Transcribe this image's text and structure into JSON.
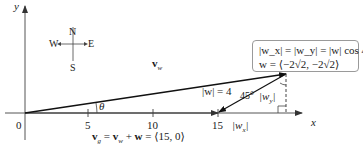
{
  "axes": {
    "x_label": "x",
    "y_label": "y",
    "origin_label": "0",
    "ticks": [
      "5",
      "10",
      "15"
    ]
  },
  "compass": {
    "north": "N",
    "south": "S",
    "east": "E",
    "west": "W"
  },
  "vectors": {
    "vw_label": "v",
    "vw_sub": "w",
    "w_magnitude": "|w| = 4",
    "angle_theta": "θ",
    "angle_45": "45°",
    "wy_label": "|w",
    "wy_sub": "y",
    "wx_label": "|w",
    "wx_sub": "x"
  },
  "equation_bottom": {
    "text": "v_g = v_w + w = ⟨15, 0⟩",
    "vg": "v",
    "vg_sub": "g",
    "eq1": " = ",
    "vw": "v",
    "vw_sub": "w",
    "plus": " + ",
    "w": "w",
    "rest": " = ⟨15, 0⟩"
  },
  "info_box": {
    "line1": "|w_x| = |w_y| = |w| cos 45°",
    "line2": "w = ⟨−2√2, −2√2⟩"
  },
  "colors": {
    "axis": "#555555",
    "vector": "#111111",
    "box_border": "#9a9a9a"
  }
}
